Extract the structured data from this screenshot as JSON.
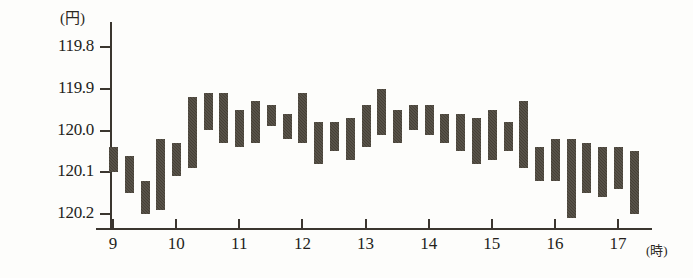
{
  "chart_data": {
    "type": "bar",
    "title": "",
    "subtitle": "",
    "xlabel": "(時)",
    "ylabel": "(円)",
    "axis_inverted_y": true,
    "grid": false,
    "legend": "none",
    "ylim": [
      119.75,
      120.22
    ],
    "xlim": [
      8.8,
      17.2
    ],
    "ytick_labels": [
      "119.8",
      "119.9",
      "120.0",
      "120.1",
      "120.2"
    ],
    "ytick_values": [
      119.8,
      119.9,
      120.0,
      120.1,
      120.2
    ],
    "xtick_labels": [
      "9",
      "10",
      "11",
      "12",
      "13",
      "14",
      "15",
      "16",
      "17"
    ],
    "xtick_values": [
      9,
      10,
      11,
      12,
      13,
      14,
      15,
      16,
      17
    ],
    "bar_color": "#4a4338",
    "axis_color": "#3b362f",
    "background_color": "#fdfdfb",
    "note": "Floating (high-low range) bars: each bar spans from its high to its low yen value over a sub-hourly interval.",
    "bars": [
      {
        "x": 9.0,
        "high": 120.04,
        "low": 120.1
      },
      {
        "x": 9.25,
        "high": 120.06,
        "low": 120.15
      },
      {
        "x": 9.5,
        "high": 120.12,
        "low": 120.2
      },
      {
        "x": 9.75,
        "high": 120.02,
        "low": 120.19
      },
      {
        "x": 10.0,
        "high": 120.03,
        "low": 120.11
      },
      {
        "x": 10.25,
        "high": 119.92,
        "low": 120.09
      },
      {
        "x": 10.5,
        "high": 119.91,
        "low": 120.0
      },
      {
        "x": 10.75,
        "high": 119.91,
        "low": 120.03
      },
      {
        "x": 11.0,
        "high": 119.95,
        "low": 120.04
      },
      {
        "x": 11.25,
        "high": 119.93,
        "low": 120.03
      },
      {
        "x": 11.5,
        "high": 119.94,
        "low": 119.99
      },
      {
        "x": 11.75,
        "high": 119.96,
        "low": 120.02
      },
      {
        "x": 12.0,
        "high": 119.91,
        "low": 120.03
      },
      {
        "x": 12.25,
        "high": 119.98,
        "low": 120.08
      },
      {
        "x": 12.5,
        "high": 119.98,
        "low": 120.05
      },
      {
        "x": 12.75,
        "high": 119.97,
        "low": 120.07
      },
      {
        "x": 13.0,
        "high": 119.94,
        "low": 120.04
      },
      {
        "x": 13.25,
        "high": 119.9,
        "low": 120.01
      },
      {
        "x": 13.5,
        "high": 119.95,
        "low": 120.03
      },
      {
        "x": 13.75,
        "high": 119.94,
        "low": 120.0
      },
      {
        "x": 14.0,
        "high": 119.94,
        "low": 120.01
      },
      {
        "x": 14.25,
        "high": 119.96,
        "low": 120.03
      },
      {
        "x": 14.5,
        "high": 119.96,
        "low": 120.05
      },
      {
        "x": 14.75,
        "high": 119.97,
        "low": 120.08
      },
      {
        "x": 15.0,
        "high": 119.95,
        "low": 120.07
      },
      {
        "x": 15.25,
        "high": 119.98,
        "low": 120.05
      },
      {
        "x": 15.5,
        "high": 119.93,
        "low": 120.09
      },
      {
        "x": 15.75,
        "high": 120.04,
        "low": 120.12
      },
      {
        "x": 16.0,
        "high": 120.02,
        "low": 120.12
      },
      {
        "x": 16.25,
        "high": 120.02,
        "low": 120.21
      },
      {
        "x": 16.5,
        "high": 120.03,
        "low": 120.15
      },
      {
        "x": 16.75,
        "high": 120.04,
        "low": 120.16
      },
      {
        "x": 17.0,
        "high": 120.04,
        "low": 120.14
      },
      {
        "x": 17.25,
        "high": 120.05,
        "low": 120.2
      }
    ]
  }
}
